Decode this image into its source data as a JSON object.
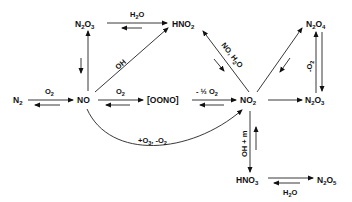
{
  "diagram": {
    "type": "reaction-network",
    "species": {
      "n2": "N2",
      "no": "NO",
      "oono": "[OONO]",
      "no2": "NO2",
      "n2o3_top": "N2O3",
      "hno2": "HNO2",
      "n2o4": "N2O4",
      "n2o3_right": "N2O3",
      "hno3": "HNO3",
      "n2o5": "N2O5"
    },
    "labels": {
      "n2_no": "O2",
      "no_oono": "O2",
      "oono_no2": "-½ O2",
      "n2o3_hno2": "H2O",
      "no_hno2": "OH",
      "no2_hno2": "NO, H2O",
      "n2o4_n2o3": "-O2",
      "no2_hno3": "OH + m",
      "hno3_n2o5": "H2O",
      "no_no2_curve": "+O3, -O2"
    }
  }
}
